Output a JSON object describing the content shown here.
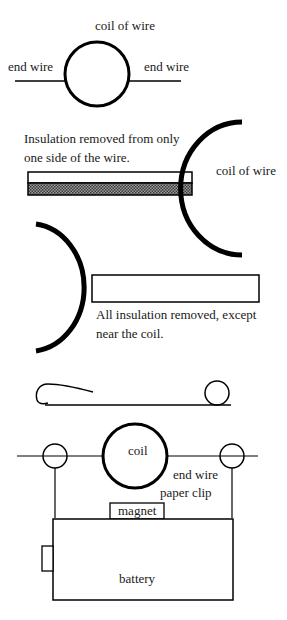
{
  "diagram": {
    "panel1": {
      "coil_label": "coil of wire",
      "end_wire_left": "end wire",
      "end_wire_right": "end wire"
    },
    "panel2": {
      "caption_line1": "Insulation removed from only",
      "caption_line2": "one side of the wire.",
      "coil_label": "coil of wire"
    },
    "panel3": {
      "caption_line1": "All insulation removed, except",
      "caption_line2": "near the coil."
    },
    "panel5": {
      "coil_label": "coil",
      "end_wire_label": "end wire",
      "paper_clip_label": "paper clip",
      "magnet_label": "magnet",
      "battery_label": "battery"
    },
    "colors": {
      "stroke": "#000000",
      "text": "#1a1a1a",
      "shading": "#6e6e6e",
      "background": "#ffffff"
    }
  }
}
